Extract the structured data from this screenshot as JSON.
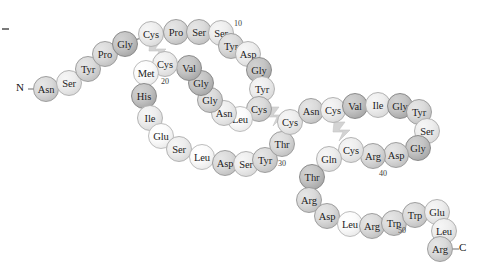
{
  "figure": {
    "termini": [
      {
        "name": "n-terminus",
        "label": "N",
        "x": 20,
        "y": 89
      },
      {
        "name": "c-terminus",
        "label": "C",
        "x": 463,
        "y": 249
      }
    ],
    "sequence_numbers": [
      {
        "label": "10",
        "x": 234,
        "y": 19
      },
      {
        "label": "20",
        "x": 161,
        "y": 77
      },
      {
        "label": "30",
        "x": 278,
        "y": 159
      },
      {
        "label": "40",
        "x": 379,
        "y": 169
      },
      {
        "label": "50",
        "x": 398,
        "y": 226
      }
    ],
    "residues": [
      {
        "i": 1,
        "label": "Asn",
        "x": 46,
        "y": 89,
        "shade": 2
      },
      {
        "i": 2,
        "label": "Ser",
        "x": 69,
        "y": 83,
        "shade": 1
      },
      {
        "i": 3,
        "label": "Tyr",
        "x": 88,
        "y": 69,
        "shade": 2
      },
      {
        "i": 4,
        "label": "Pro",
        "x": 105,
        "y": 54,
        "shade": 2
      },
      {
        "i": 5,
        "label": "Gly",
        "x": 125,
        "y": 44,
        "shade": 3
      },
      {
        "i": 6,
        "label": "Cys",
        "x": 151,
        "y": 34,
        "shade": 1
      },
      {
        "i": 7,
        "label": "Pro",
        "x": 176,
        "y": 32,
        "shade": 2
      },
      {
        "i": 8,
        "label": "Ser",
        "x": 199,
        "y": 32,
        "shade": 2
      },
      {
        "i": 9,
        "label": "Ser",
        "x": 221,
        "y": 33,
        "shade": 1
      },
      {
        "i": 10,
        "label": "Tyr",
        "x": 231,
        "y": 46,
        "shade": 2
      },
      {
        "i": 11,
        "label": "Asp",
        "x": 248,
        "y": 54,
        "shade": 1
      },
      {
        "i": 12,
        "label": "Gly",
        "x": 259,
        "y": 70,
        "shade": 3
      },
      {
        "i": 13,
        "label": "Tyr",
        "x": 262,
        "y": 89,
        "shade": 1
      },
      {
        "i": 14,
        "label": "Cys",
        "x": 259,
        "y": 109,
        "shade": 2
      },
      {
        "i": 15,
        "label": "Leu",
        "x": 240,
        "y": 119,
        "shade": 0
      },
      {
        "i": 16,
        "label": "Asn",
        "x": 224,
        "y": 113,
        "shade": 1
      },
      {
        "i": 17,
        "label": "Gly",
        "x": 210,
        "y": 100,
        "shade": 2
      },
      {
        "i": 18,
        "label": "Gly",
        "x": 201,
        "y": 83,
        "shade": 3
      },
      {
        "i": 19,
        "label": "Val",
        "x": 189,
        "y": 68,
        "shade": 3
      },
      {
        "i": 20,
        "label": "Cys",
        "x": 165,
        "y": 64,
        "shade": 1
      },
      {
        "i": 21,
        "label": "Met",
        "x": 146,
        "y": 73,
        "shade": 0
      },
      {
        "i": 22,
        "label": "His",
        "x": 144,
        "y": 96,
        "shade": 3
      },
      {
        "i": 23,
        "label": "Ile",
        "x": 150,
        "y": 118,
        "shade": 1
      },
      {
        "i": 24,
        "label": "Glu",
        "x": 161,
        "y": 136,
        "shade": 0
      },
      {
        "i": 25,
        "label": "Ser",
        "x": 179,
        "y": 149,
        "shade": 1
      },
      {
        "i": 26,
        "label": "Leu",
        "x": 202,
        "y": 157,
        "shade": 0
      },
      {
        "i": 27,
        "label": "Asp",
        "x": 225,
        "y": 163,
        "shade": 2
      },
      {
        "i": 28,
        "label": "Ser",
        "x": 246,
        "y": 164,
        "shade": 1
      },
      {
        "i": 29,
        "label": "Tyr",
        "x": 265,
        "y": 160,
        "shade": 2
      },
      {
        "i": 30,
        "label": "Thr",
        "x": 282,
        "y": 144,
        "shade": 2
      },
      {
        "i": 31,
        "label": "Cys",
        "x": 290,
        "y": 122,
        "shade": 1
      },
      {
        "i": 32,
        "label": "Asn",
        "x": 311,
        "y": 111,
        "shade": 2
      },
      {
        "i": 33,
        "label": "Cys",
        "x": 333,
        "y": 110,
        "shade": 1
      },
      {
        "i": 34,
        "label": "Val",
        "x": 355,
        "y": 106,
        "shade": 3
      },
      {
        "i": 35,
        "label": "Ile",
        "x": 378,
        "y": 105,
        "shade": 1
      },
      {
        "i": 36,
        "label": "Gly",
        "x": 400,
        "y": 106,
        "shade": 3
      },
      {
        "i": 37,
        "label": "Tyr",
        "x": 419,
        "y": 112,
        "shade": 2
      },
      {
        "i": 38,
        "label": "Ser",
        "x": 427,
        "y": 131,
        "shade": 1
      },
      {
        "i": 39,
        "label": "Gly",
        "x": 418,
        "y": 148,
        "shade": 3
      },
      {
        "i": 40,
        "label": "Asp",
        "x": 396,
        "y": 155,
        "shade": 2
      },
      {
        "i": 41,
        "label": "Arg",
        "x": 373,
        "y": 156,
        "shade": 2
      },
      {
        "i": 42,
        "label": "Cys",
        "x": 351,
        "y": 150,
        "shade": 1
      },
      {
        "i": 43,
        "label": "Gln",
        "x": 329,
        "y": 159,
        "shade": 1
      },
      {
        "i": 44,
        "label": "Thr",
        "x": 312,
        "y": 177,
        "shade": 3
      },
      {
        "i": 45,
        "label": "Arg",
        "x": 309,
        "y": 200,
        "shade": 2
      },
      {
        "i": 46,
        "label": "Asp",
        "x": 327,
        "y": 216,
        "shade": 2
      },
      {
        "i": 47,
        "label": "Leu",
        "x": 350,
        "y": 224,
        "shade": 0
      },
      {
        "i": 48,
        "label": "Arg",
        "x": 372,
        "y": 226,
        "shade": 2
      },
      {
        "i": 49,
        "label": "Trp",
        "x": 394,
        "y": 223,
        "shade": 2
      },
      {
        "i": 50,
        "label": "Trp",
        "x": 415,
        "y": 215,
        "shade": 2
      },
      {
        "i": 51,
        "label": "Glu",
        "x": 437,
        "y": 212,
        "shade": 1
      },
      {
        "i": 52,
        "label": "Leu",
        "x": 444,
        "y": 231,
        "shade": 1
      },
      {
        "i": 53,
        "label": "Arg",
        "x": 440,
        "y": 249,
        "shade": 2
      }
    ],
    "disulfide_bonds": [
      {
        "name": "disulfide-bond-1",
        "from": 6,
        "to": 20,
        "x": 158,
        "y": 50
      },
      {
        "name": "disulfide-bond-2",
        "from": 14,
        "to": 31,
        "x": 276,
        "y": 116
      },
      {
        "name": "disulfide-bond-3",
        "from": 33,
        "to": 42,
        "x": 342,
        "y": 131
      }
    ],
    "colors": {
      "background": "#ffffff",
      "bond_line": "#8d8d8d",
      "bead_outline": "#a8a8a8",
      "disulfide": "#d3d3d3",
      "text": "#1b1b1b"
    }
  }
}
